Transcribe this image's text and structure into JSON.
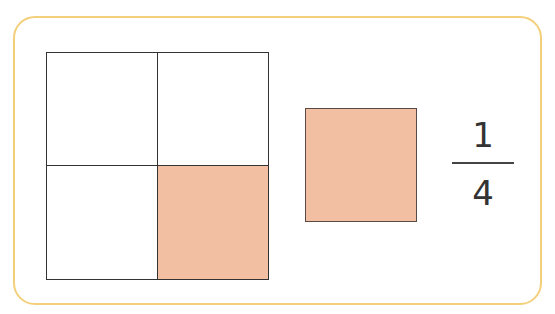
{
  "figure": {
    "grid": {
      "rows": 2,
      "cols": 2,
      "cells": [
        {
          "position": "top-left",
          "shaded": false
        },
        {
          "position": "top-right",
          "shaded": false
        },
        {
          "position": "bottom-left",
          "shaded": false
        },
        {
          "position": "bottom-right",
          "shaded": true
        }
      ]
    },
    "part_square": {
      "shaded": true
    },
    "fraction": {
      "numerator": "1",
      "denominator": "4"
    },
    "colors": {
      "frame": "#f3cf7a",
      "shade": "#f3bfa2",
      "outline": "#333333"
    }
  }
}
